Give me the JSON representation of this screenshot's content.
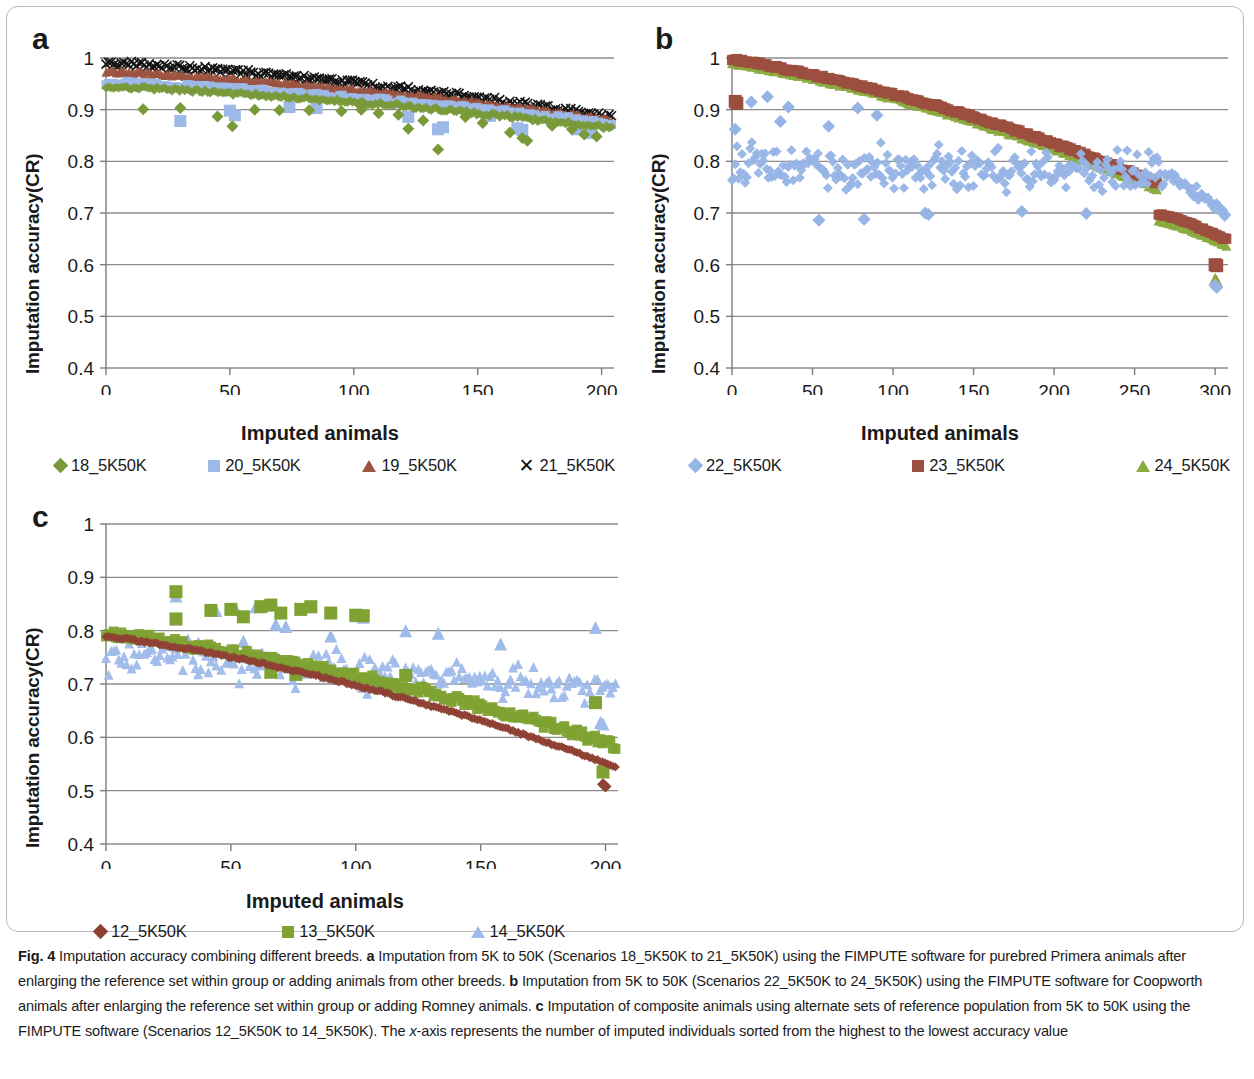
{
  "figure": {
    "label": "Fig. 4",
    "caption_segments": [
      {
        "t": "Fig. 4",
        "b": true
      },
      {
        "t": "  Imputation accuracy combining different breeds. ",
        "b": false
      },
      {
        "t": "a",
        "b": true
      },
      {
        "t": " Imputation from 5K to 50K (Scenarios 18_5K50K to 21_5K50K) using the FIMPUTE software for purebred Primera animals after enlarging the reference set within group or adding animals from other breeds. ",
        "b": false
      },
      {
        "t": "b",
        "b": true
      },
      {
        "t": " Imputation from 5K to 50K (Scenarios 22_5K50K to 24_5K50K) using the FIMPUTE software for Coopworth animals after enlarging the reference set within group or adding Romney animals. ",
        "b": false
      },
      {
        "t": "c",
        "b": true
      },
      {
        "t": " Imputation of composite animals using alternate sets of reference population from 5K to 50K using the FIMPUTE software (Scenarios 12_5K50K to 14_5K50K). The ",
        "b": false
      },
      {
        "t": "x",
        "b": false,
        "i": true
      },
      {
        "t": "-axis represents the number of imputed individuals sorted from the highest to the lowest accuracy value",
        "b": false
      }
    ],
    "caption_plain": "Fig. 4  Imputation accuracy combining different breeds. a Imputation from 5K to 50K (Scenarios 18_5K50K to 21_5K50K) using the FIMPUTE software for purebred Primera animals after enlarging the reference set within group or adding animals from other breeds. b Imputation from 5K to 50K (Scenarios 22_5K50K to 24_5K50K) using the FIMPUTE software for Coopworth animals after enlarging the reference set within group or adding Romney animals. c Imputation of composite animals using alternate sets of reference population from 5K to 50K using the FIMPUTE software (Scenarios 12_5K50K to 14_5K50K). The x-axis represents the number of imputed individuals sorted from the highest to the lowest accuracy value"
  },
  "colors": {
    "green_diamond": "#7a9a3a",
    "blue_square": "#9cb9e8",
    "brown_triangle": "#9c5442",
    "black_x": "#111111",
    "blue_diamond": "#96b4e6",
    "red_square": "#9c4f3f",
    "green_triangle": "#8aab3f",
    "dark_red_diamond": "#8f4234",
    "green_square": "#7fa233",
    "blue_triangle": "#9fbbea",
    "gridline": "#8c8c8c",
    "axis": "#7d7d7d",
    "text": "#1a1a1a",
    "frame": "#b9b9b9"
  },
  "chart_data": [
    {
      "id": "panel-a",
      "panel": "a",
      "type": "scatter",
      "title": "",
      "xlabel": "Imputed animals",
      "ylabel": "Imputation accuracy(CR)",
      "xlim": [
        0,
        205
      ],
      "ylim": [
        0.4,
        1.0
      ],
      "xticks": [
        0,
        50,
        100,
        150,
        200
      ],
      "yticks": [
        0.4,
        0.5,
        0.6,
        0.7,
        0.8,
        0.9,
        1
      ],
      "ytick_labels": [
        "0.4",
        "0.5",
        "0.6",
        "0.7",
        "0.8",
        "0.9",
        "1"
      ],
      "grid": true,
      "legend_position": "bottom",
      "n_points": 200,
      "series": [
        {
          "name": "18_5K50K",
          "marker": "diamond",
          "color": "#7a9a3a",
          "size": 9,
          "band": {
            "start": 0.945,
            "end": 0.865,
            "curve": 0.35,
            "jitter": 0.008
          },
          "outliers": [
            [
              15,
              0.901
            ],
            [
              30,
              0.903
            ],
            [
              45,
              0.887
            ],
            [
              51,
              0.868
            ],
            [
              60,
              0.9
            ],
            [
              70,
              0.899
            ],
            [
              82,
              0.899
            ],
            [
              95,
              0.897
            ],
            [
              103,
              0.9
            ],
            [
              110,
              0.893
            ],
            [
              118,
              0.89
            ],
            [
              122,
              0.863
            ],
            [
              128,
              0.879
            ],
            [
              134,
              0.823
            ],
            [
              145,
              0.886
            ],
            [
              152,
              0.874
            ],
            [
              163,
              0.856
            ],
            [
              168,
              0.845
            ],
            [
              170,
              0.84
            ],
            [
              180,
              0.869
            ],
            [
              188,
              0.862
            ],
            [
              193,
              0.852
            ],
            [
              198,
              0.848
            ]
          ]
        },
        {
          "name": "20_5K50K",
          "marker": "square",
          "color": "#9cb9e8",
          "size": 9,
          "band": {
            "start": 0.952,
            "end": 0.872,
            "curve": 0.35,
            "jitter": 0.01
          },
          "outliers": [
            [
              30,
              0.878
            ],
            [
              50,
              0.898
            ],
            [
              52,
              0.889
            ],
            [
              74,
              0.905
            ],
            [
              85,
              0.903
            ],
            [
              122,
              0.886
            ],
            [
              134,
              0.862
            ],
            [
              136,
              0.866
            ],
            [
              155,
              0.888
            ],
            [
              166,
              0.864
            ],
            [
              168,
              0.861
            ],
            [
              190,
              0.862
            ],
            [
              196,
              0.855
            ]
          ]
        },
        {
          "name": "19_5K50K",
          "marker": "triangle",
          "color": "#9c5442",
          "size": 9,
          "band": {
            "start": 0.975,
            "end": 0.88,
            "curve": 0.38,
            "jitter": 0.007
          },
          "outliers": [
            [
              113,
              0.933
            ],
            [
              133,
              0.925
            ],
            [
              135,
              0.922
            ]
          ]
        },
        {
          "name": "21_5K50K",
          "marker": "x",
          "color": "#111111",
          "size": 9,
          "band": {
            "start": 0.992,
            "end": 0.885,
            "curve": 0.42,
            "jitter": 0.011
          },
          "outliers": []
        }
      ]
    },
    {
      "id": "panel-b",
      "panel": "b",
      "type": "scatter",
      "title": "",
      "xlabel": "Imputed animals",
      "ylabel": "Imputation accuracy(CR)",
      "xlim": [
        0,
        308
      ],
      "ylim": [
        0.4,
        1.0
      ],
      "xticks": [
        0,
        50,
        100,
        150,
        200,
        250,
        300
      ],
      "yticks": [
        0.4,
        0.5,
        0.6,
        0.7,
        0.8,
        0.9,
        1
      ],
      "ytick_labels": [
        "0.4",
        "0.5",
        "0.6",
        "0.7",
        "0.8",
        "0.9",
        "1"
      ],
      "grid": true,
      "legend_position": "bottom",
      "n_points": 300,
      "series": [
        {
          "name": "22_5K50K",
          "marker": "diamond",
          "color": "#96b4e6",
          "size": 10,
          "cloud": {
            "y_center_start": 0.79,
            "y_center_end": 0.775,
            "spread": 0.055,
            "n": 300,
            "tail_from": 262,
            "tail_end": 0.695
          },
          "outliers": [
            [
              2,
              0.862
            ],
            [
              12,
              0.915
            ],
            [
              22,
              0.925
            ],
            [
              30,
              0.877
            ],
            [
              35,
              0.905
            ],
            [
              54,
              0.686
            ],
            [
              60,
              0.868
            ],
            [
              78,
              0.903
            ],
            [
              82,
              0.688
            ],
            [
              90,
              0.889
            ],
            [
              120,
              0.7
            ],
            [
              122,
              0.697
            ],
            [
              180,
              0.703
            ],
            [
              220,
              0.699
            ],
            [
              300,
              0.56
            ],
            [
              301,
              0.556
            ]
          ]
        },
        {
          "name": "23_5K50K",
          "marker": "square",
          "color": "#9c4f3f",
          "size": 10,
          "band": {
            "start": 0.998,
            "end": 0.7,
            "curve": 0.55,
            "jitter": 0.006,
            "drop_from": 258,
            "drop_end": 0.65
          },
          "outliers": [
            [
              2,
              0.916
            ],
            [
              3,
              0.912
            ],
            [
              300,
              0.6
            ],
            [
              301,
              0.598
            ]
          ]
        },
        {
          "name": "24_5K50K",
          "marker": "triangle",
          "color": "#8aab3f",
          "size": 10,
          "band": {
            "start": 0.992,
            "end": 0.688,
            "curve": 0.55,
            "jitter": 0.006,
            "drop_from": 258,
            "drop_end": 0.64
          },
          "outliers": [
            [
              300,
              0.572
            ],
            [
              301,
              0.568
            ]
          ]
        }
      ]
    },
    {
      "id": "panel-c",
      "panel": "c",
      "type": "scatter",
      "title": "",
      "xlabel": "Imputed animals",
      "ylabel": "Imputation accuracy(CR)",
      "xlim": [
        0,
        205
      ],
      "ylim": [
        0.4,
        1.0
      ],
      "xticks": [
        0,
        50,
        100,
        150,
        200
      ],
      "yticks": [
        0.4,
        0.5,
        0.6,
        0.7,
        0.8,
        0.9,
        1
      ],
      "ytick_labels": [
        "0.4",
        "0.5",
        "0.6",
        "0.7",
        "0.8",
        "0.9",
        "1"
      ],
      "grid": true,
      "legend_position": "bottom",
      "n_points": 200,
      "series": [
        {
          "name": "12_5K50K",
          "marker": "diamond",
          "color": "#8f4234",
          "size": 9,
          "band": {
            "start": 0.79,
            "end": 0.545,
            "curve": 0.62,
            "jitter": 0.004
          },
          "outliers": [
            [
              199,
              0.512
            ],
            [
              200,
              0.508
            ]
          ]
        },
        {
          "name": "13_5K50K",
          "marker": "square",
          "color": "#7fa233",
          "size": 10,
          "band": {
            "start": 0.795,
            "end": 0.585,
            "curve": 0.6,
            "jitter": 0.016
          },
          "outliers": [
            [
              28,
              0.873
            ],
            [
              28,
              0.822
            ],
            [
              42,
              0.838
            ],
            [
              50,
              0.84
            ],
            [
              55,
              0.826
            ],
            [
              62,
              0.845
            ],
            [
              66,
              0.848
            ],
            [
              70,
              0.833
            ],
            [
              78,
              0.84
            ],
            [
              82,
              0.845
            ],
            [
              90,
              0.833
            ],
            [
              100,
              0.829
            ],
            [
              103,
              0.828
            ],
            [
              66,
              0.722
            ],
            [
              76,
              0.718
            ],
            [
              120,
              0.716
            ],
            [
              196,
              0.665
            ],
            [
              199,
              0.535
            ]
          ]
        },
        {
          "name": "14_5K50K",
          "marker": "triangle",
          "color": "#9fbbea",
          "size": 10,
          "cloud": {
            "y_center_start": 0.76,
            "y_center_end": 0.69,
            "spread": 0.045,
            "n": 200,
            "tail_from": 200,
            "tail_end": 0.64
          },
          "outliers": [
            [
              28,
              0.865
            ],
            [
              28,
              0.822
            ],
            [
              37,
              0.777
            ],
            [
              44,
              0.838
            ],
            [
              52,
              0.84
            ],
            [
              55,
              0.78
            ],
            [
              60,
              0.845
            ],
            [
              64,
              0.848
            ],
            [
              68,
              0.812
            ],
            [
              72,
              0.808
            ],
            [
              78,
              0.84
            ],
            [
              82,
              0.845
            ],
            [
              90,
              0.79
            ],
            [
              100,
              0.828
            ],
            [
              103,
              0.825
            ],
            [
              120,
              0.8
            ],
            [
              133,
              0.795
            ],
            [
              158,
              0.775
            ],
            [
              196,
              0.806
            ],
            [
              198,
              0.628
            ],
            [
              199,
              0.625
            ]
          ]
        }
      ]
    }
  ],
  "panels": {
    "a": {
      "letter": "a",
      "legend": [
        {
          "label": "18_5K50K",
          "marker": "diamond",
          "color": "#7a9a3a"
        },
        {
          "label": "20_5K50K",
          "marker": "square",
          "color": "#9cb9e8"
        },
        {
          "label": "19_5K50K",
          "marker": "triangle",
          "color": "#9c5442"
        },
        {
          "label": "21_5K50K",
          "marker": "x",
          "color": "#111111"
        }
      ]
    },
    "b": {
      "letter": "b",
      "legend": [
        {
          "label": "22_5K50K",
          "marker": "diamond",
          "color": "#96b4e6"
        },
        {
          "label": "23_5K50K",
          "marker": "square",
          "color": "#9c4f3f"
        },
        {
          "label": "24_5K50K",
          "marker": "triangle",
          "color": "#8aab3f"
        }
      ]
    },
    "c": {
      "letter": "c",
      "legend": [
        {
          "label": "12_5K50K",
          "marker": "diamond",
          "color": "#8f4234"
        },
        {
          "label": "13_5K50K",
          "marker": "square",
          "color": "#7fa233"
        },
        {
          "label": "14_5K50K",
          "marker": "triangle",
          "color": "#9fbbea"
        }
      ]
    }
  }
}
